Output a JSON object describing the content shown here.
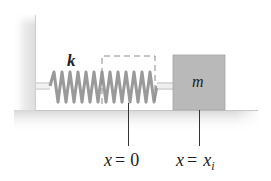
{
  "diagram": {
    "type": "spring-mass system",
    "spring_label": "k",
    "mass_label": "m",
    "positions": [
      {
        "var": "x",
        "eq": "=",
        "value": "0",
        "subscript": ""
      },
      {
        "var": "x",
        "eq": "=",
        "value": "x",
        "subscript": "i"
      }
    ],
    "colors": {
      "wall": "#e6e6e6",
      "floor": "#e3e3e3",
      "spring": "#9a9a9a",
      "block": "#b9b9b9",
      "dashed_box": "#888888",
      "lines": "#333333",
      "text": "#222222"
    }
  }
}
